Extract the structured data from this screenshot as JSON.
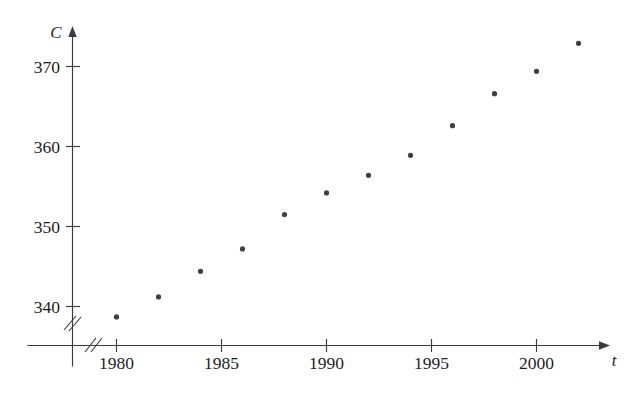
{
  "figure": {
    "name": "co2-scatter-plot",
    "background_color": "#ffffff",
    "ink_color": "#3a3a42",
    "point_color": "#3f3f47"
  },
  "axes": {
    "x": {
      "label": "t",
      "tick_labels": [
        "1980",
        "1985",
        "1990",
        "1995",
        "2000"
      ],
      "tick_values": [
        1980,
        1985,
        1990,
        1995,
        2000
      ],
      "has_arrow": true,
      "has_break": true
    },
    "y": {
      "label": "C",
      "tick_labels": [
        "340",
        "350",
        "360",
        "370"
      ],
      "tick_values": [
        340,
        350,
        360,
        370
      ],
      "has_arrow": true,
      "has_break": true
    }
  },
  "chart_data": {
    "type": "scatter",
    "title": "",
    "xlabel": "t",
    "ylabel": "C",
    "xlim": [
      1978.8,
      2003.5
    ],
    "ylim": [
      337.5,
      374.5
    ],
    "grid": false,
    "legend": null,
    "x": [
      1980,
      1982,
      1984,
      1986,
      1988,
      1990,
      1992,
      1994,
      1996,
      1998,
      2000,
      2002
    ],
    "y": [
      338.7,
      341.2,
      344.4,
      347.2,
      351.5,
      354.2,
      356.4,
      358.9,
      362.6,
      366.6,
      369.4,
      372.9
    ],
    "points": [
      {
        "x": 1980,
        "y": 338.7
      },
      {
        "x": 1982,
        "y": 341.2
      },
      {
        "x": 1984,
        "y": 344.4
      },
      {
        "x": 1986,
        "y": 347.2
      },
      {
        "x": 1988,
        "y": 351.5
      },
      {
        "x": 1990,
        "y": 354.2
      },
      {
        "x": 1992,
        "y": 356.4
      },
      {
        "x": 1994,
        "y": 358.9
      },
      {
        "x": 1996,
        "y": 362.6
      },
      {
        "x": 1998,
        "y": 366.6
      },
      {
        "x": 2000,
        "y": 369.4
      },
      {
        "x": 2002,
        "y": 372.9
      }
    ],
    "xticks": [
      1980,
      1985,
      1990,
      1995,
      2000
    ],
    "yticks": [
      340,
      350,
      360,
      370
    ]
  }
}
